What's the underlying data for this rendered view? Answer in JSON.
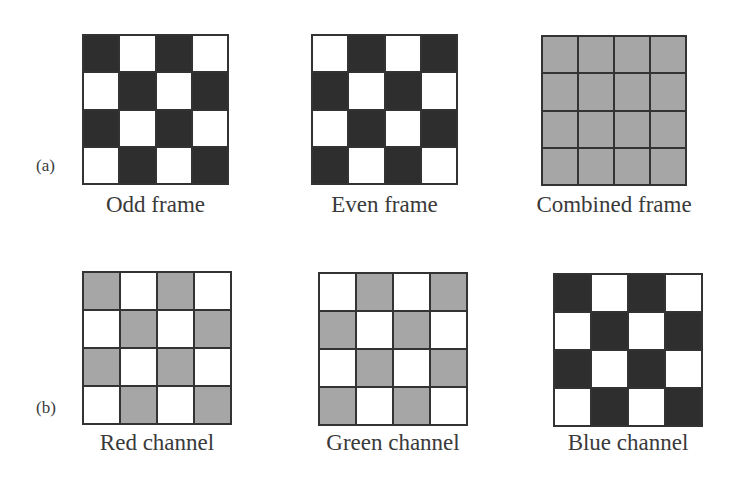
{
  "rows": [
    {
      "label": "(a)",
      "panels": [
        {
          "caption": "Odd frame",
          "cells": [
            [
              "dark",
              "white",
              "dark",
              "white"
            ],
            [
              "white",
              "dark",
              "white",
              "dark"
            ],
            [
              "dark",
              "white",
              "dark",
              "white"
            ],
            [
              "white",
              "dark",
              "white",
              "dark"
            ]
          ]
        },
        {
          "caption": "Even frame",
          "cells": [
            [
              "white",
              "dark",
              "white",
              "dark"
            ],
            [
              "dark",
              "white",
              "dark",
              "white"
            ],
            [
              "white",
              "dark",
              "white",
              "dark"
            ],
            [
              "dark",
              "white",
              "dark",
              "white"
            ]
          ]
        },
        {
          "caption": "Combined frame",
          "cells": [
            [
              "gray",
              "gray",
              "gray",
              "gray"
            ],
            [
              "gray",
              "gray",
              "gray",
              "gray"
            ],
            [
              "gray",
              "gray",
              "gray",
              "gray"
            ],
            [
              "gray",
              "gray",
              "gray",
              "gray"
            ]
          ]
        }
      ]
    },
    {
      "label": "(b)",
      "panels": [
        {
          "caption": "Red channel",
          "cells": [
            [
              "gray",
              "white",
              "gray",
              "white"
            ],
            [
              "white",
              "gray",
              "white",
              "gray"
            ],
            [
              "gray",
              "white",
              "gray",
              "white"
            ],
            [
              "white",
              "gray",
              "white",
              "gray"
            ]
          ]
        },
        {
          "caption": "Green channel",
          "cells": [
            [
              "white",
              "gray",
              "white",
              "gray"
            ],
            [
              "gray",
              "white",
              "gray",
              "white"
            ],
            [
              "white",
              "gray",
              "white",
              "gray"
            ],
            [
              "gray",
              "white",
              "gray",
              "white"
            ]
          ]
        },
        {
          "caption": "Blue channel",
          "cells": [
            [
              "dark",
              "white",
              "dark",
              "white"
            ],
            [
              "white",
              "dark",
              "white",
              "dark"
            ],
            [
              "dark",
              "white",
              "dark",
              "white"
            ],
            [
              "white",
              "dark",
              "white",
              "dark"
            ]
          ]
        }
      ]
    }
  ],
  "colors": {
    "dark": "#2e2e2e",
    "gray": "#a6a6a6",
    "white": "#ffffff",
    "border": "#333333"
  }
}
